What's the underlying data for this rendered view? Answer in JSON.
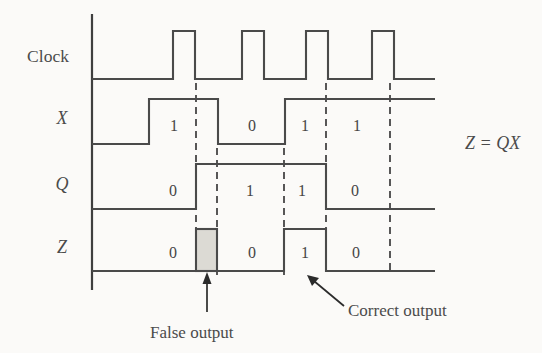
{
  "figure": {
    "background_color": "#fbfaf8",
    "line_color": "#4a4a4a",
    "shade_fill_color": "#dcdad4",
    "equation": "Z = QX"
  },
  "rows": [
    {
      "key": "clock",
      "label": "Clock",
      "italic": false
    },
    {
      "key": "x",
      "label": "X",
      "italic": true
    },
    {
      "key": "q",
      "label": "Q",
      "italic": true
    },
    {
      "key": "z",
      "label": "Z",
      "italic": true
    }
  ],
  "annotations": [
    {
      "key": "false-output",
      "text": "False output"
    },
    {
      "key": "correct-output",
      "text": "Correct output"
    }
  ],
  "chart_data": {
    "type": "line",
    "xlabel": "",
    "ylabel": "",
    "grid": false,
    "legend": "none",
    "x_axis_px": {
      "start": 92,
      "end": 435
    },
    "signals": [
      {
        "name": "Clock",
        "baseline_px": 79,
        "high_px": 31,
        "bit_labels": [],
        "pulses": [
          {
            "rise_px": 173,
            "fall_px": 195
          },
          {
            "rise_px": 242,
            "fall_px": 264
          },
          {
            "rise_px": 306,
            "fall_px": 328
          },
          {
            "rise_px": 372,
            "fall_px": 394
          }
        ],
        "segments": [
          {
            "from_px": 92,
            "to_px": 173,
            "level": 0
          },
          {
            "from_px": 173,
            "to_px": 195,
            "level": 1
          },
          {
            "from_px": 195,
            "to_px": 242,
            "level": 0
          },
          {
            "from_px": 242,
            "to_px": 264,
            "level": 1
          },
          {
            "from_px": 264,
            "to_px": 306,
            "level": 0
          },
          {
            "from_px": 306,
            "to_px": 328,
            "level": 1
          },
          {
            "from_px": 328,
            "to_px": 372,
            "level": 0
          },
          {
            "from_px": 372,
            "to_px": 394,
            "level": 1
          },
          {
            "from_px": 394,
            "to_px": 435,
            "level": 0
          }
        ]
      },
      {
        "name": "X",
        "baseline_px": 144,
        "high_px": 99,
        "bit_labels": [
          {
            "value": "1",
            "x_px": 174,
            "y_px": 131
          },
          {
            "value": "0",
            "x_px": 252,
            "y_px": 131
          },
          {
            "value": "1",
            "x_px": 305,
            "y_px": 131
          },
          {
            "value": "1",
            "x_px": 357,
            "y_px": 131
          }
        ],
        "segments": [
          {
            "from_px": 92,
            "to_px": 149,
            "level": 0
          },
          {
            "from_px": 149,
            "to_px": 218,
            "level": 1
          },
          {
            "from_px": 218,
            "to_px": 285,
            "level": 0
          },
          {
            "from_px": 285,
            "to_px": 435,
            "level": 1
          }
        ]
      },
      {
        "name": "Q",
        "baseline_px": 209,
        "high_px": 164,
        "bit_labels": [
          {
            "value": "0",
            "x_px": 173,
            "y_px": 196
          },
          {
            "value": "1",
            "x_px": 250,
            "y_px": 196
          },
          {
            "value": "1",
            "x_px": 302,
            "y_px": 196
          },
          {
            "value": "0",
            "x_px": 355,
            "y_px": 196
          }
        ],
        "segments": [
          {
            "from_px": 92,
            "to_px": 196,
            "level": 0
          },
          {
            "from_px": 196,
            "to_px": 326,
            "level": 1
          },
          {
            "from_px": 326,
            "to_px": 435,
            "level": 0
          }
        ]
      },
      {
        "name": "Z",
        "baseline_px": 271,
        "high_px": 229,
        "bit_labels": [
          {
            "value": "0",
            "x_px": 173,
            "y_px": 258
          },
          {
            "value": "0",
            "x_px": 252,
            "y_px": 258
          },
          {
            "value": "1",
            "x_px": 305,
            "y_px": 258
          },
          {
            "value": "0",
            "x_px": 356,
            "y_px": 258
          }
        ],
        "segments": [
          {
            "from_px": 92,
            "to_px": 196,
            "level": 0
          },
          {
            "from_px": 217,
            "to_px": 284,
            "level": 0
          },
          {
            "from_px": 284,
            "to_px": 326,
            "level": 1
          },
          {
            "from_px": 326,
            "to_px": 435,
            "level": 0
          }
        ],
        "shaded_pulse": {
          "from_px": 196,
          "to_px": 217,
          "label": "false output glitch"
        }
      }
    ],
    "dashed_markers": [
      {
        "x_px": 196,
        "from_px_y": 83,
        "to_px_y": 275
      },
      {
        "x_px": 217,
        "from_px_y": 148,
        "to_px_y": 275
      },
      {
        "x_px": 284,
        "from_px_y": 148,
        "to_px_y": 275
      },
      {
        "x_px": 326,
        "from_px_y": 83,
        "to_px_y": 275
      },
      {
        "x_px": 390,
        "from_px_y": 83,
        "to_px_y": 275
      }
    ]
  }
}
